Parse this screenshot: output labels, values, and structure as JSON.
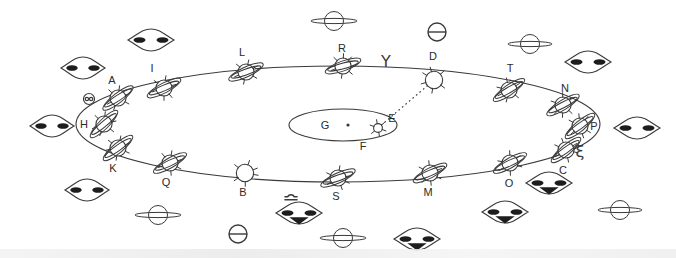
{
  "figure": {
    "stroke_color": "#3a3a3a",
    "background_color": "#ffffff",
    "label_color": "#2b2b2b"
  },
  "orbit": {
    "name": "large-ellipse-orbit",
    "cx": 338,
    "cy": 124,
    "rx": 262,
    "ry": 58,
    "dash": "solid"
  },
  "center_object": {
    "name": "central-flat-ellipse",
    "cx": 343,
    "cy": 125,
    "rx": 54,
    "ry": 16,
    "point_label": "G",
    "point_x": 348,
    "point_y": 125,
    "below_label": "F"
  },
  "sight_line": {
    "name": "dotted-sight-line",
    "from": "E",
    "to": "D",
    "x1": 378,
    "y1": 128,
    "x2": 434,
    "y2": 80,
    "style": "dotted"
  },
  "orbit_bodies": [
    {
      "id": "A",
      "label": "A",
      "x": 118,
      "y": 98,
      "lx": 112,
      "ly": 80,
      "type": "ringed",
      "tilt": -38,
      "size": 13
    },
    {
      "id": "I",
      "label": "I",
      "x": 164,
      "y": 88,
      "lx": 152,
      "ly": 68,
      "type": "ringed",
      "tilt": -28,
      "size": 13
    },
    {
      "id": "L",
      "label": "L",
      "x": 246,
      "y": 72,
      "lx": 242,
      "ly": 52,
      "type": "ringed",
      "tilt": -25,
      "size": 13
    },
    {
      "id": "R",
      "label": "R",
      "x": 343,
      "y": 66,
      "lx": 342,
      "ly": 48,
      "type": "ringed",
      "tilt": -20,
      "size": 13
    },
    {
      "id": "D",
      "label": "D",
      "x": 434,
      "y": 80,
      "lx": 433,
      "ly": 56,
      "type": "plain",
      "tilt": -15,
      "size": 14
    },
    {
      "id": "T",
      "label": "T",
      "x": 509,
      "y": 90,
      "lx": 510,
      "ly": 68,
      "type": "ringed",
      "tilt": -35,
      "size": 13
    },
    {
      "id": "N",
      "label": "N",
      "x": 563,
      "y": 105,
      "lx": 565,
      "ly": 88,
      "type": "ringed",
      "tilt": -32,
      "size": 13
    },
    {
      "id": "P",
      "label": "P",
      "x": 580,
      "y": 126,
      "lx": 594,
      "ly": 126,
      "type": "ringed",
      "tilt": -40,
      "size": 13
    },
    {
      "id": "C",
      "label": "C",
      "x": 566,
      "y": 150,
      "lx": 563,
      "ly": 170,
      "type": "ringed",
      "tilt": -40,
      "size": 13
    },
    {
      "id": "O",
      "label": "O",
      "x": 510,
      "y": 163,
      "lx": 509,
      "ly": 183,
      "type": "ringed",
      "tilt": -30,
      "size": 13
    },
    {
      "id": "M",
      "label": "M",
      "x": 430,
      "y": 173,
      "lx": 428,
      "ly": 192,
      "type": "ringed",
      "tilt": -28,
      "size": 13
    },
    {
      "id": "S",
      "label": "S",
      "x": 338,
      "y": 178,
      "lx": 336,
      "ly": 196,
      "type": "ringed",
      "tilt": -25,
      "size": 13
    },
    {
      "id": "B",
      "label": "B",
      "x": 245,
      "y": 173,
      "lx": 243,
      "ly": 192,
      "type": "plain",
      "tilt": -15,
      "size": 14
    },
    {
      "id": "Q",
      "label": "Q",
      "x": 170,
      "y": 163,
      "lx": 166,
      "ly": 182,
      "type": "ringed",
      "tilt": -30,
      "size": 13
    },
    {
      "id": "K",
      "label": "K",
      "x": 118,
      "y": 148,
      "lx": 113,
      "ly": 168,
      "type": "ringed",
      "tilt": -40,
      "size": 13
    },
    {
      "id": "H",
      "label": "H",
      "x": 104,
      "y": 124,
      "lx": 84,
      "ly": 124,
      "type": "ringed",
      "tilt": -45,
      "size": 13
    },
    {
      "id": "E",
      "label": "E",
      "x": 378,
      "y": 128,
      "lx": 392,
      "ly": 118,
      "type": "small-star",
      "tilt": 0,
      "size": 8
    }
  ],
  "astro_symbols": [
    {
      "name": "aries-symbol",
      "label": "Υ",
      "x": 386,
      "y": 62,
      "size": 16
    },
    {
      "name": "earth-symbol-top",
      "label": "circle-bar",
      "x": 437,
      "y": 32,
      "size": 18
    },
    {
      "name": "earth-symbol-bottom",
      "label": "circle-bar",
      "x": 238,
      "y": 234,
      "size": 18
    },
    {
      "name": "libra-symbol",
      "label": "libra",
      "x": 291,
      "y": 194,
      "size": 12
    },
    {
      "name": "xi-symbol",
      "label": "ξ",
      "x": 580,
      "y": 152,
      "size": 16
    },
    {
      "name": "double-dot-circle-symbol",
      "label": "circle-two-dots",
      "x": 89,
      "y": 99,
      "size": 11
    }
  ],
  "saucers": [
    {
      "name": "saucer",
      "variant": "winged-dark",
      "x": 83,
      "y": 68,
      "w": 44,
      "h": 22
    },
    {
      "name": "saucer",
      "variant": "winged-dark",
      "x": 151,
      "y": 40,
      "w": 46,
      "h": 22
    },
    {
      "name": "saucer",
      "variant": "ring-plain",
      "x": 334,
      "y": 21,
      "w": 46,
      "h": 20
    },
    {
      "name": "saucer",
      "variant": "ring-plain",
      "x": 530,
      "y": 44,
      "w": 44,
      "h": 20
    },
    {
      "name": "saucer",
      "variant": "winged-dark",
      "x": 588,
      "y": 62,
      "w": 46,
      "h": 22
    },
    {
      "name": "saucer",
      "variant": "winged-dark",
      "x": 52,
      "y": 126,
      "w": 44,
      "h": 22
    },
    {
      "name": "saucer",
      "variant": "winged-dark",
      "x": 637,
      "y": 128,
      "w": 46,
      "h": 22
    },
    {
      "name": "saucer",
      "variant": "winged-dark",
      "x": 87,
      "y": 190,
      "w": 44,
      "h": 22
    },
    {
      "name": "saucer",
      "variant": "ring-plain",
      "x": 158,
      "y": 215,
      "w": 46,
      "h": 20
    },
    {
      "name": "saucer",
      "variant": "ring-plain",
      "x": 343,
      "y": 238,
      "w": 46,
      "h": 20
    },
    {
      "name": "saucer",
      "variant": "winged-dark-filled",
      "x": 417,
      "y": 239,
      "w": 46,
      "h": 22
    },
    {
      "name": "saucer",
      "variant": "winged-dark-filled",
      "x": 505,
      "y": 212,
      "w": 46,
      "h": 22
    },
    {
      "name": "saucer",
      "variant": "winged-dark-filled",
      "x": 549,
      "y": 183,
      "w": 46,
      "h": 22
    },
    {
      "name": "saucer",
      "variant": "winged-dark-filled",
      "x": 299,
      "y": 213,
      "w": 46,
      "h": 22
    },
    {
      "name": "saucer",
      "variant": "ring-plain",
      "x": 620,
      "y": 210,
      "w": 44,
      "h": 20
    }
  ]
}
